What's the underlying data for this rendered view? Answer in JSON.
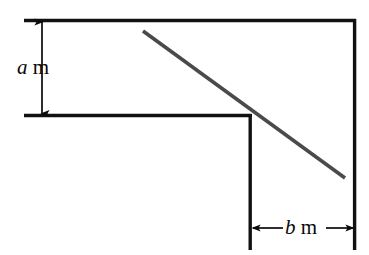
{
  "figure": {
    "type": "geometry-diagram",
    "background_color": "#ffffff",
    "structure_line_color": "#111111",
    "ladder_line_color": "#4a4a4a",
    "arrow_color": "#0a0a0a",
    "labels": [
      {
        "id": "label-a",
        "name": "height-label",
        "variable": "a",
        "unit": "m",
        "text": "a m",
        "orientation": "vertical",
        "arrow": "double-headed",
        "measures": "vertical gap between the top wall line and the ledge line"
      },
      {
        "id": "label-b",
        "name": "width-label",
        "variable": "b",
        "unit": "m",
        "text": "b m",
        "orientation": "horizontal",
        "arrow": "double-headed",
        "measures": "horizontal gap between the inner vertical wall and the right-hand wall"
      }
    ],
    "geometry": {
      "top_wall_line": {
        "x1": 24,
        "y1": 20,
        "x2": 356,
        "y2": 20
      },
      "ledge_line": {
        "x1": 24,
        "y1": 115,
        "x2": 251,
        "y2": 115
      },
      "inner_vertical_wall": {
        "x1": 250,
        "y1": 115,
        "x2": 250,
        "y2": 250
      },
      "right_vertical_wall": {
        "x1": 355,
        "y1": 20,
        "x2": 355,
        "y2": 250
      },
      "ladder_line": {
        "x1": 143,
        "y1": 31,
        "x2": 345,
        "y2": 178
      },
      "height_arrow": {
        "x": 42,
        "y1": 20,
        "y2": 115
      },
      "width_arrow": {
        "y": 228,
        "x1": 251,
        "x2": 354
      }
    }
  }
}
